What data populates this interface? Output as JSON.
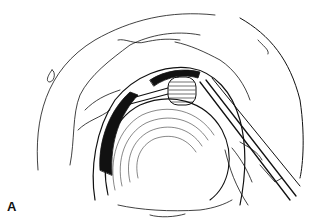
{
  "figure": {
    "panel_label": "A",
    "colors": {
      "ink": "#111111",
      "background": "#ffffff"
    }
  }
}
